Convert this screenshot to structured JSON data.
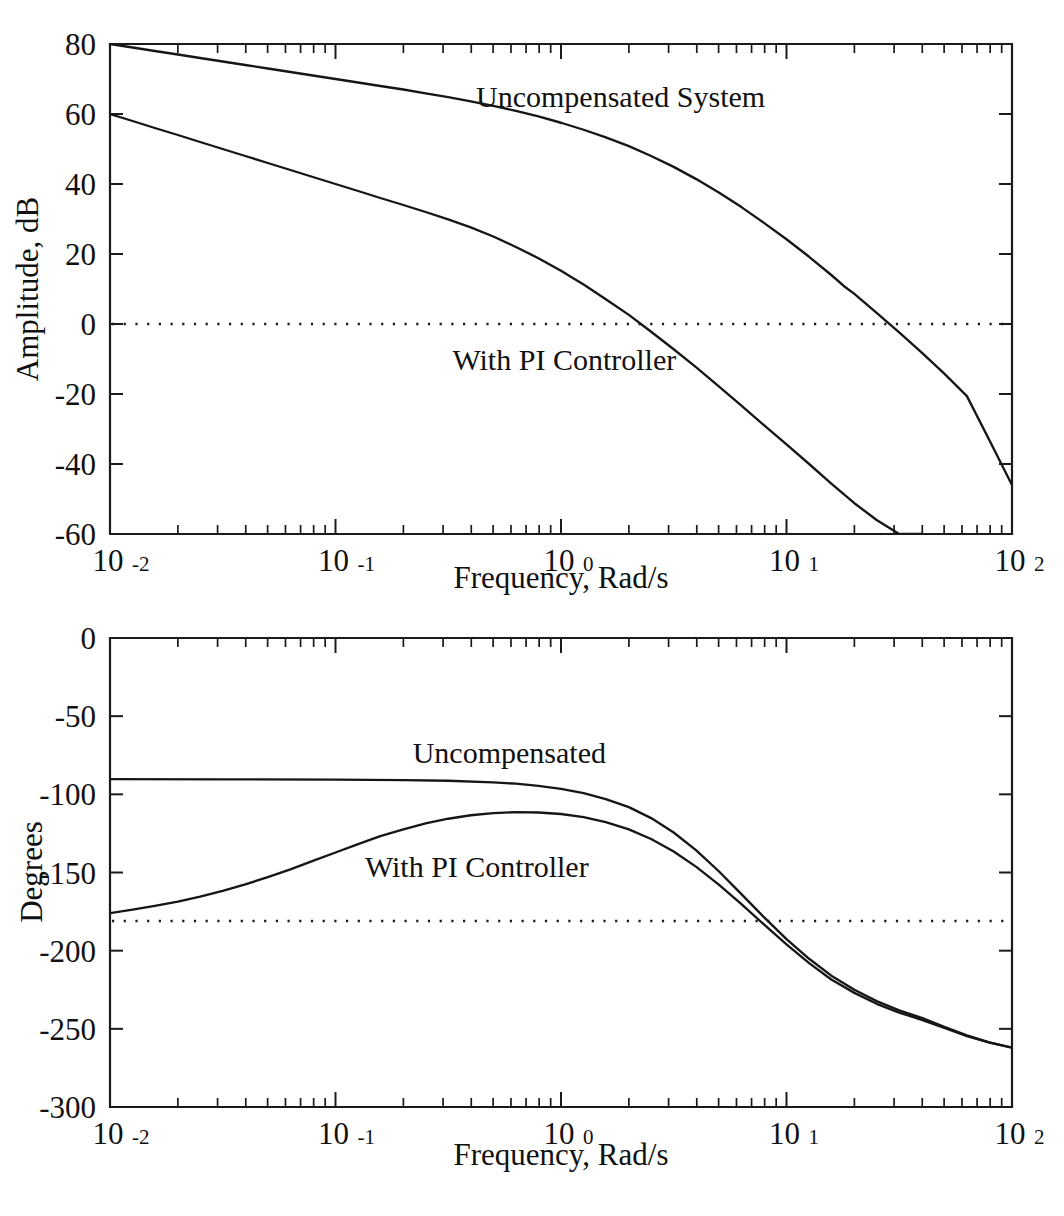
{
  "figure": {
    "background_color": "#ffffff",
    "ink_color": "#111111",
    "top_caption_fragment": ""
  },
  "chart_data": [
    {
      "type": "line",
      "name": "magnitude-plot",
      "title": "",
      "xlabel": "Frequency, Rad/s",
      "ylabel": "Amplitude, dB",
      "xscale": "log",
      "xlim": [
        0.01,
        100
      ],
      "ylim": [
        -60,
        80
      ],
      "yticks": [
        -60,
        -40,
        -20,
        0,
        20,
        40,
        60,
        80
      ],
      "ytick_labels": [
        "-60",
        "-40",
        "-20",
        "0",
        "20",
        "40",
        "60",
        "80"
      ],
      "xticks": [
        0.01,
        0.1,
        1,
        10,
        100
      ],
      "xtick_labels": [
        {
          "base": "10",
          "exp": "-2"
        },
        {
          "base": "10",
          "exp": "-1"
        },
        {
          "base": "10",
          "exp": "0"
        },
        {
          "base": "10",
          "exp": "1"
        },
        {
          "base": "10",
          "exp": "2"
        }
      ],
      "grid": false,
      "legend": "inline-annotations",
      "reference_lines": [
        {
          "name": "zero-db-line",
          "axis": "y",
          "value": 0,
          "style": "dotted"
        }
      ],
      "annotations": [
        {
          "name": "uncompensated-system-label",
          "text": "Uncompensated System",
          "x": 0.42,
          "y": 62
        },
        {
          "name": "with-pi-controller-label",
          "text": "With PI Controller",
          "x": 0.33,
          "y": -13
        }
      ],
      "series": [
        {
          "name": "Uncompensated System",
          "x": [
            0.01,
            0.0126,
            0.0158,
            0.02,
            0.0251,
            0.0316,
            0.0398,
            0.0501,
            0.0631,
            0.0794,
            0.1,
            0.126,
            0.158,
            0.2,
            0.251,
            0.316,
            0.398,
            0.501,
            0.631,
            0.794,
            1.0,
            1.26,
            1.58,
            2.0,
            2.51,
            3.16,
            3.98,
            5.01,
            6.31,
            7.94,
            10.0,
            12.6,
            15.8,
            18.0,
            20.0,
            25.1,
            31.6,
            39.8,
            50.1,
            63.1,
            79.4,
            100.0
          ],
          "values": [
            80.0,
            79.0,
            78.0,
            77.0,
            76.0,
            75.0,
            74.0,
            73.0,
            72.0,
            71.0,
            70.0,
            69.0,
            68.0,
            67.0,
            65.9,
            64.8,
            63.6,
            62.3,
            60.9,
            59.3,
            57.5,
            55.5,
            53.3,
            50.8,
            48.0,
            44.9,
            41.4,
            37.6,
            33.4,
            28.9,
            24.2,
            19.2,
            14.0,
            10.8,
            8.6,
            3.2,
            -2.4,
            -8.2,
            -14.2,
            -20.6,
            -33.2,
            -46.0
          ]
        },
        {
          "name": "With PI Controller",
          "x": [
            0.01,
            0.0126,
            0.0158,
            0.02,
            0.0251,
            0.0316,
            0.0398,
            0.0501,
            0.0631,
            0.0794,
            0.1,
            0.126,
            0.158,
            0.2,
            0.251,
            0.316,
            0.398,
            0.501,
            0.631,
            0.794,
            1.0,
            1.1,
            1.26,
            1.58,
            2.0,
            2.51,
            3.16,
            3.98,
            5.01,
            6.31,
            7.94,
            10.0,
            12.6,
            15.8,
            20.0,
            25.1,
            31.6,
            39.8
          ],
          "values": [
            60.0,
            58.0,
            56.0,
            54.0,
            52.0,
            50.0,
            48.0,
            46.0,
            44.0,
            42.0,
            40.0,
            38.0,
            36.0,
            34.0,
            32.0,
            29.9,
            27.6,
            25.0,
            22.0,
            18.8,
            15.2,
            13.6,
            11.3,
            7.1,
            2.6,
            -2.2,
            -7.2,
            -12.4,
            -17.8,
            -23.3,
            -28.9,
            -34.4,
            -40.0,
            -45.6,
            -51.2,
            -56.0,
            -60.0,
            -60.0
          ]
        }
      ]
    },
    {
      "type": "line",
      "name": "phase-plot",
      "title": "",
      "xlabel": "Frequency, Rad/s",
      "ylabel": "Degrees",
      "xscale": "log",
      "xlim": [
        0.01,
        100
      ],
      "ylim": [
        -300,
        0
      ],
      "yticks": [
        -300,
        -250,
        -200,
        -150,
        -100,
        -50,
        0
      ],
      "ytick_labels": [
        "-300",
        "-250",
        "-200",
        "-150",
        "-100",
        "-50",
        "0"
      ],
      "xticks": [
        0.01,
        0.1,
        1,
        10,
        100
      ],
      "xtick_labels": [
        {
          "base": "10",
          "exp": "-2"
        },
        {
          "base": "10",
          "exp": "-1"
        },
        {
          "base": "10",
          "exp": "0"
        },
        {
          "base": "10",
          "exp": "1"
        },
        {
          "base": "10",
          "exp": "2"
        }
      ],
      "grid": false,
      "legend": "inline-annotations",
      "reference_lines": [
        {
          "name": "minus-180-deg-line",
          "axis": "y",
          "value": -181,
          "style": "dotted"
        }
      ],
      "annotations": [
        {
          "name": "uncompensated-label",
          "text": "Uncompensated",
          "x": 0.22,
          "y": -80
        },
        {
          "name": "with-pi-controller-label",
          "text": "With PI Controller",
          "x": 0.135,
          "y": -153
        }
      ],
      "series": [
        {
          "name": "Uncompensated",
          "x": [
            0.01,
            0.0316,
            0.1,
            0.2,
            0.316,
            0.5,
            0.631,
            0.794,
            1.0,
            1.26,
            1.58,
            2.0,
            2.51,
            3.16,
            3.98,
            5.01,
            6.31,
            7.94,
            10.0,
            12.6,
            15.8,
            20.0,
            25.1,
            31.6,
            39.8,
            50.1,
            63.1,
            79.4,
            100.0
          ],
          "values": [
            -90.3,
            -90.4,
            -90.6,
            -90.9,
            -91.3,
            -92.3,
            -93.2,
            -94.6,
            -96.5,
            -99.2,
            -103.0,
            -108.2,
            -115.2,
            -124.4,
            -135.8,
            -149.2,
            -163.8,
            -178.6,
            -192.6,
            -205.2,
            -216.0,
            -225.0,
            -232.3,
            -238.2,
            -243.0,
            -248.8,
            -254.2,
            -258.6,
            -262.0
          ]
        },
        {
          "name": "With PI Controller",
          "x": [
            0.01,
            0.0126,
            0.0158,
            0.02,
            0.0251,
            0.0316,
            0.0398,
            0.0501,
            0.0631,
            0.0794,
            0.1,
            0.126,
            0.158,
            0.2,
            0.251,
            0.316,
            0.398,
            0.501,
            0.631,
            0.794,
            1.0,
            1.26,
            1.58,
            2.0,
            2.51,
            3.16,
            3.98,
            5.01,
            6.31,
            7.94,
            10.0,
            12.6,
            15.8,
            20.0,
            25.1,
            31.6,
            39.8,
            50.1,
            63.1,
            79.4,
            100.0
          ],
          "values": [
            -176.0,
            -173.8,
            -171.4,
            -168.6,
            -165.4,
            -161.8,
            -157.6,
            -153.0,
            -148.0,
            -142.6,
            -137.2,
            -131.8,
            -126.8,
            -122.4,
            -118.6,
            -115.6,
            -113.4,
            -112.0,
            -111.4,
            -111.6,
            -112.6,
            -114.6,
            -117.8,
            -122.4,
            -128.6,
            -136.6,
            -146.4,
            -157.8,
            -170.2,
            -183.2,
            -196.0,
            -208.0,
            -218.4,
            -227.0,
            -234.0,
            -239.6,
            -244.2,
            -249.4,
            -254.6,
            -258.8,
            -262.0
          ]
        }
      ]
    }
  ]
}
